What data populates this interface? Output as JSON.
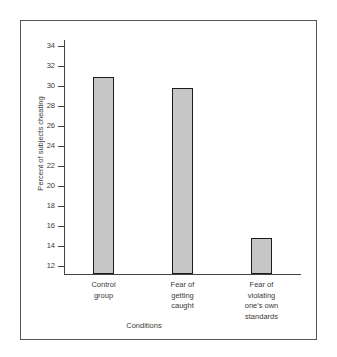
{
  "chart_data": {
    "type": "bar",
    "title": "",
    "xlabel": "Conditions",
    "ylabel": "Percent of subjects cheating",
    "categories": [
      "Control group",
      "Fear of getting caught",
      "Fear of violating one's own standards"
    ],
    "category_lines": [
      [
        "Control",
        "group"
      ],
      [
        "Fear of",
        "getting",
        "caught"
      ],
      [
        "Fear of",
        "violating",
        "one's own",
        "standards"
      ]
    ],
    "values": [
      30.9,
      29.8,
      14.8
    ],
    "ylim": [
      11.2,
      34.6
    ],
    "yticks": [
      34,
      32,
      30,
      28,
      26,
      24,
      22,
      20,
      18,
      16,
      14,
      12
    ],
    "ytick_labels": [
      "34",
      "32",
      "30",
      "28",
      "26",
      "24",
      "22",
      "20",
      "18",
      "16",
      "14",
      "12"
    ],
    "grid": false,
    "legend": false,
    "bar_fill": "#c6c6c6",
    "bar_edge": "#1c1c1c",
    "frame_color": "#555555",
    "axis_color": "#444444",
    "text_color": "#3a3a3a"
  }
}
